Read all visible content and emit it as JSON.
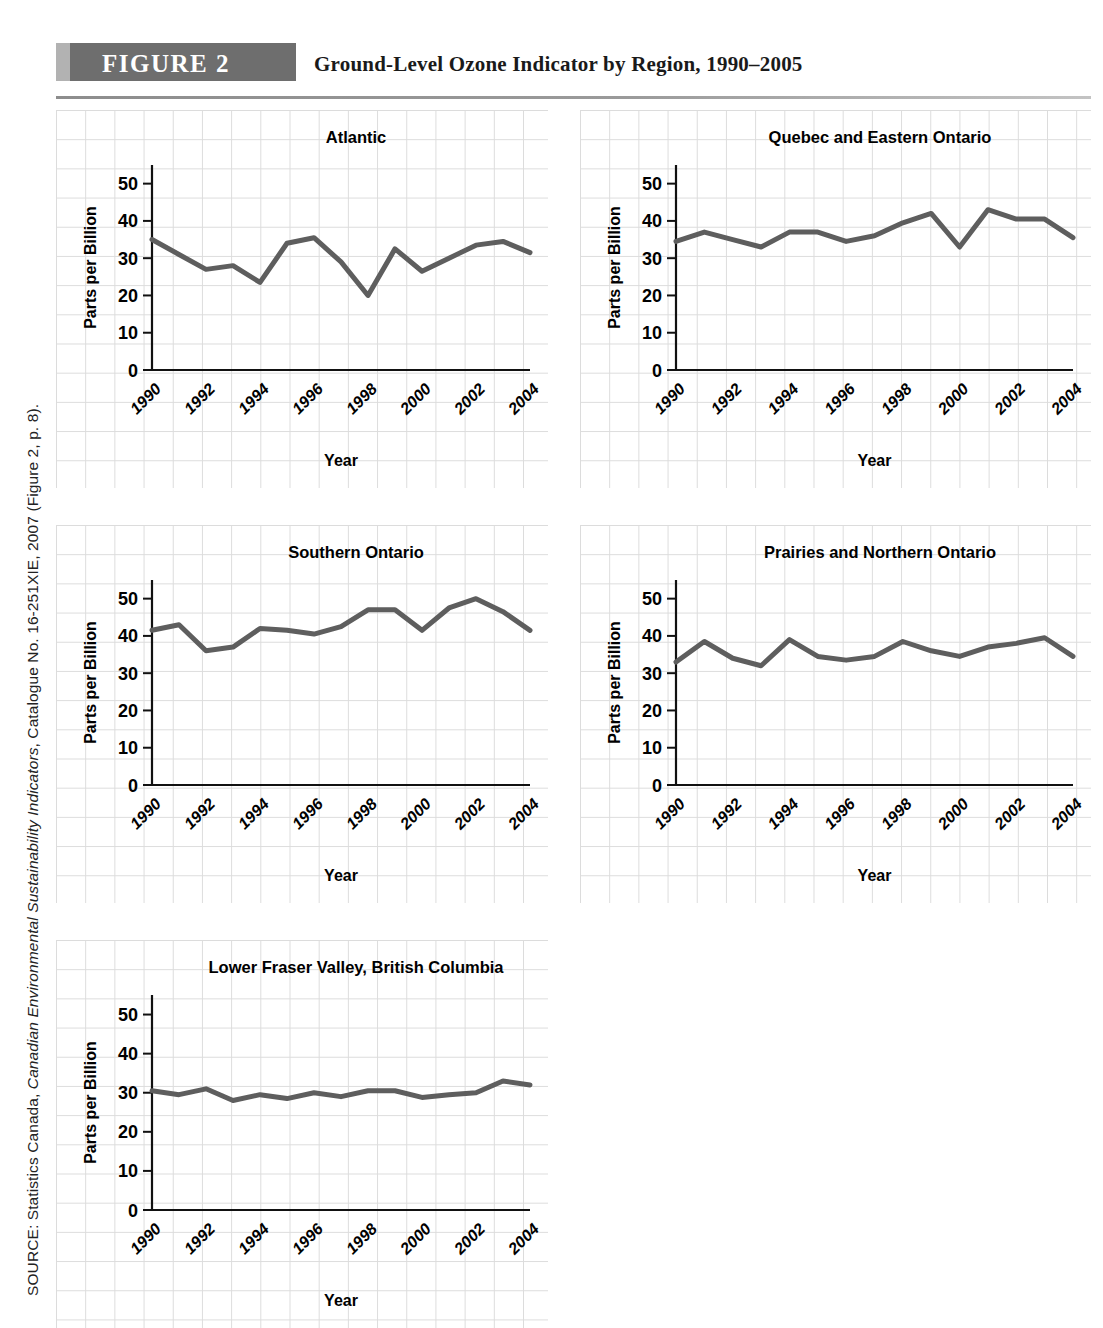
{
  "source": {
    "prefix": "SOURCE: Statistics Canada, ",
    "italic_title": "Canadian Environmental Sustainability Indicators",
    "suffix": ", Catalogue No. 16-251XIE, 2007 (Figure 2, p. 8).",
    "full": "SOURCE: Statistics Canada, Canadian Environmental Sustainability Indicators, Catalogue No. 16-251XIE, 2007 (Figure 2, p. 8)."
  },
  "header": {
    "badge_label": "FIGURE 2",
    "title": "Ground-Level Ozone Indicator by Region, 1990–2005",
    "badge_color": "#6e6e6e",
    "badge_accent_color": "#b2b2b2",
    "rule_color": "#9a9a9a"
  },
  "colors": {
    "line": "#5e5e5e",
    "grid": "#dcdcdc",
    "axis": "#111111",
    "text": "#000000"
  },
  "axis_common": {
    "xlabel": "Year",
    "ylabel": "Parts per Billion",
    "ylim": [
      0,
      55
    ],
    "yticks": [
      0,
      10,
      20,
      30,
      40,
      50
    ],
    "ytick_labels": [
      "0",
      "10",
      "20",
      "30",
      "40",
      "50"
    ],
    "xtick_labels": [
      "1990",
      "1992",
      "1994",
      "1996",
      "1998",
      "2000",
      "2002",
      "2004"
    ],
    "xtick_years": [
      1990,
      1992,
      1994,
      1996,
      1998,
      2000,
      2002,
      2004
    ],
    "xlim": [
      1990,
      2004
    ],
    "grid": true,
    "legend": "none"
  },
  "chart_data": [
    {
      "type": "line",
      "title": "Atlantic",
      "xlabel": "Year",
      "ylabel": "Parts per Billion",
      "ylim": [
        0,
        55
      ],
      "yticks": [
        0,
        10,
        20,
        30,
        40,
        50
      ],
      "x": [
        1990,
        1991,
        1992,
        1993,
        1994,
        1995,
        1996,
        1997,
        1998,
        1999,
        2000,
        2001,
        2002,
        2003,
        2004
      ],
      "values": [
        35.0,
        31.0,
        27.0,
        28.0,
        23.5,
        34.0,
        35.5,
        29.0,
        20.0,
        32.5,
        26.5,
        30.0,
        33.5,
        34.5,
        31.5
      ]
    },
    {
      "type": "line",
      "title": "Quebec and Eastern Ontario",
      "xlabel": "Year",
      "ylabel": "Parts per Billion",
      "ylim": [
        0,
        55
      ],
      "yticks": [
        0,
        10,
        20,
        30,
        40,
        50
      ],
      "x": [
        1990,
        1991,
        1992,
        1993,
        1994,
        1995,
        1996,
        1997,
        1998,
        1999,
        2000,
        2001,
        2002,
        2003,
        2004
      ],
      "values": [
        34.5,
        37.0,
        35.0,
        33.0,
        37.0,
        37.0,
        34.5,
        36.0,
        39.5,
        42.0,
        33.0,
        43.0,
        40.5,
        40.5,
        35.5
      ]
    },
    {
      "type": "line",
      "title": "Southern Ontario",
      "xlabel": "Year",
      "ylabel": "Parts per Billion",
      "ylim": [
        0,
        55
      ],
      "yticks": [
        0,
        10,
        20,
        30,
        40,
        50
      ],
      "x": [
        1990,
        1991,
        1992,
        1993,
        1994,
        1995,
        1996,
        1997,
        1998,
        1999,
        2000,
        2001,
        2002,
        2003,
        2004
      ],
      "values": [
        41.5,
        43.0,
        36.0,
        37.0,
        42.0,
        41.5,
        40.5,
        42.5,
        47.0,
        47.0,
        41.5,
        47.5,
        50.0,
        46.5,
        41.5
      ]
    },
    {
      "type": "line",
      "title": "Prairies and Northern Ontario",
      "xlabel": "Year",
      "ylabel": "Parts per Billion",
      "ylim": [
        0,
        55
      ],
      "yticks": [
        0,
        10,
        20,
        30,
        40,
        50
      ],
      "x": [
        1990,
        1991,
        1992,
        1993,
        1994,
        1995,
        1996,
        1997,
        1998,
        1999,
        2000,
        2001,
        2002,
        2003,
        2004
      ],
      "values": [
        33.0,
        38.5,
        34.0,
        32.0,
        39.0,
        34.5,
        33.5,
        34.5,
        38.5,
        36.0,
        34.5,
        37.0,
        38.0,
        39.5,
        34.5
      ]
    },
    {
      "type": "line",
      "title": "Lower Fraser Valley, British Columbia",
      "xlabel": "Year",
      "ylabel": "Parts per Billion",
      "ylim": [
        0,
        55
      ],
      "yticks": [
        0,
        10,
        20,
        30,
        40,
        50
      ],
      "x": [
        1990,
        1991,
        1992,
        1993,
        1994,
        1995,
        1996,
        1997,
        1998,
        1999,
        2000,
        2001,
        2002,
        2003,
        2004
      ],
      "values": [
        30.5,
        29.5,
        31.0,
        28.0,
        29.5,
        28.5,
        30.0,
        29.0,
        30.5,
        30.5,
        28.8,
        29.5,
        30.0,
        33.0,
        32.0
      ]
    }
  ],
  "panels": [
    {
      "index": 0,
      "name": "panel-atlantic",
      "left": 56,
      "top": 110,
      "width": 492,
      "height": 378,
      "title_x": 300
    },
    {
      "index": 1,
      "name": "panel-quebec",
      "left": 580,
      "top": 110,
      "width": 511,
      "height": 378,
      "title_x": 300
    },
    {
      "index": 2,
      "name": "panel-southern-ontario",
      "left": 56,
      "top": 525,
      "width": 492,
      "height": 378,
      "title_x": 300
    },
    {
      "index": 3,
      "name": "panel-prairies",
      "left": 580,
      "top": 525,
      "width": 511,
      "height": 378,
      "title_x": 300
    },
    {
      "index": 4,
      "name": "panel-lower-fraser-valley",
      "left": 56,
      "top": 940,
      "width": 492,
      "height": 388,
      "title_x": 300
    }
  ]
}
